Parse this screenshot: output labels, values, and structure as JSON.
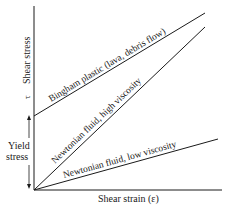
{
  "diagram": {
    "type": "rheology-stress-strain",
    "x_axis": {
      "label": "Shear strain (ε)"
    },
    "y_axis": {
      "label": "Shear stress",
      "symbol": "τ"
    },
    "yield_stress": {
      "label_line1": "Yield",
      "label_line2": "stress"
    },
    "lines": [
      {
        "name": "bingham",
        "label": "Bingham plastic (lava, debris flow)"
      },
      {
        "name": "newtonian-high",
        "label": "Newtonian fluid, high viscosity"
      },
      {
        "name": "newtonian-low",
        "label": "Newtonian fluid, low viscosity"
      }
    ],
    "colors": {
      "ink": "#1a1a1a",
      "background": "#ffffff"
    }
  }
}
